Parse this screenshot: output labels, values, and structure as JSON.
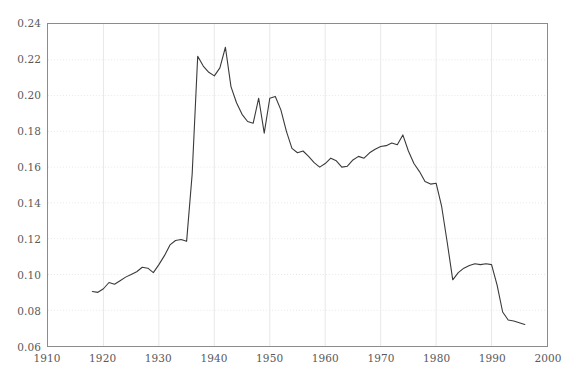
{
  "chart_data": {
    "type": "line",
    "title": "",
    "subtitle": "",
    "xlabel": "",
    "ylabel": "",
    "xlim": [
      1910,
      2000
    ],
    "ylim": [
      0.06,
      0.24
    ],
    "xticks": [
      1910,
      1920,
      1930,
      1940,
      1950,
      1960,
      1970,
      1980,
      1990,
      2000
    ],
    "xtick_labels": [
      "1910",
      "1920",
      "1930",
      "1940",
      "1950",
      "1960",
      "1970",
      "1980",
      "1990",
      "2000"
    ],
    "yticks": [
      0.06,
      0.08,
      0.1,
      0.12,
      0.14,
      0.16,
      0.18,
      0.2,
      0.22,
      0.24
    ],
    "ytick_labels": [
      "0.06",
      "0.08",
      "0.10",
      "0.12",
      "0.14",
      "0.16",
      "0.18",
      "0.20",
      "0.22",
      "0.24"
    ],
    "grid": true,
    "grid_color": "#e8e8e8",
    "legend": false,
    "legend_position": "none",
    "line_color": "#3a3a3a",
    "line_width": 1.1,
    "frame_color": "#8c8c8c",
    "background_color": "#ffffff",
    "tick_label_color": "#595959",
    "series": [
      {
        "name": "series-1",
        "x": [
          1918,
          1919,
          1920,
          1921,
          1922,
          1923,
          1924,
          1925,
          1926,
          1927,
          1928,
          1929,
          1930,
          1931,
          1932,
          1933,
          1934,
          1935,
          1936,
          1937,
          1938,
          1939,
          1940,
          1941,
          1942,
          1943,
          1944,
          1945,
          1946,
          1947,
          1948,
          1949,
          1950,
          1951,
          1952,
          1953,
          1954,
          1955,
          1956,
          1957,
          1958,
          1959,
          1960,
          1961,
          1962,
          1963,
          1964,
          1965,
          1966,
          1967,
          1968,
          1969,
          1970,
          1971,
          1972,
          1973,
          1974,
          1975,
          1976,
          1977,
          1978,
          1979,
          1980,
          1981,
          1982,
          1983,
          1984,
          1985,
          1986,
          1987,
          1988,
          1989,
          1990,
          1991,
          1992,
          1993,
          1994,
          1995,
          1996
        ],
        "y": [
          0.0905,
          0.09,
          0.092,
          0.0955,
          0.0945,
          0.0965,
          0.0985,
          0.1,
          0.1015,
          0.104,
          0.1035,
          0.101,
          0.1055,
          0.1105,
          0.1165,
          0.119,
          0.1195,
          0.1185,
          0.156,
          0.222,
          0.2165,
          0.213,
          0.211,
          0.2155,
          0.227,
          0.205,
          0.196,
          0.1895,
          0.1855,
          0.1845,
          0.1985,
          0.179,
          0.1985,
          0.1995,
          0.192,
          0.18,
          0.1705,
          0.168,
          0.169,
          0.166,
          0.1625,
          0.16,
          0.162,
          0.165,
          0.1635,
          0.16,
          0.1605,
          0.164,
          0.166,
          0.165,
          0.168,
          0.17,
          0.1715,
          0.172,
          0.1735,
          0.1725,
          0.178,
          0.169,
          0.162,
          0.1575,
          0.152,
          0.1505,
          0.151,
          0.138,
          0.118,
          0.097,
          0.101,
          0.1035,
          0.105,
          0.106,
          0.1055,
          0.106,
          0.1055,
          0.094,
          0.079,
          0.0745,
          0.074,
          0.073,
          0.072
        ]
      }
    ]
  }
}
